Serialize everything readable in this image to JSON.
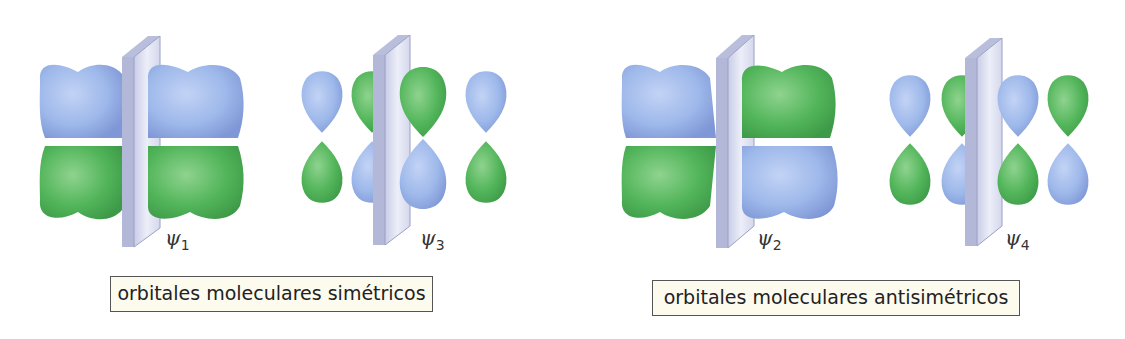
{
  "colors": {
    "blue_lobe": "#9db8ea",
    "green_lobe": "#52b55a",
    "plane": "#dcdff0",
    "caption_bg": "#fdfbee",
    "caption_border": "#555555"
  },
  "orbitals": [
    {
      "id": "psi1",
      "symbol": "ψ",
      "index": "1",
      "group": "symmetric",
      "description": "two lobe pairs, blue on top, green on bottom, both sides of the mirror plane"
    },
    {
      "id": "psi3",
      "symbol": "ψ",
      "index": "3",
      "group": "symmetric",
      "lobes_top": [
        "blue",
        "green",
        "green",
        "blue"
      ],
      "lobes_bottom": [
        "green",
        "blue",
        "blue",
        "green"
      ]
    },
    {
      "id": "psi2",
      "symbol": "ψ",
      "index": "2",
      "group": "antisymmetric",
      "description": "left pair blue top / green bottom, right pair green top / blue bottom"
    },
    {
      "id": "psi4",
      "symbol": "ψ",
      "index": "4",
      "group": "antisymmetric",
      "lobes_top": [
        "blue",
        "green",
        "blue",
        "green"
      ],
      "lobes_bottom": [
        "green",
        "blue",
        "green",
        "blue"
      ]
    }
  ],
  "captions": {
    "symmetric": "orbitales moleculares simétricos",
    "antisymmetric": "orbitales moleculares antisimétricos"
  }
}
